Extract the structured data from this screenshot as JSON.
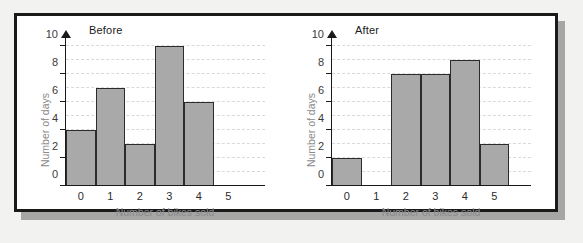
{
  "figure": {
    "background_color": "#f2f2f0",
    "panel_background": "#ffffff",
    "frame_color": "#1a1a1a",
    "bar_fill_color": "#a9a9a9",
    "bar_edge_color": "#2b2b2b",
    "gridline_color": "#d9d9dd",
    "axis_label_color": "#8a8a8a"
  },
  "chart_data": [
    {
      "type": "bar",
      "title": "Before",
      "xlabel": "Number of bikes sold",
      "ylabel": "Number of days",
      "categories": [
        "0",
        "1",
        "2",
        "3",
        "4",
        "5"
      ],
      "values": [
        4,
        7,
        3,
        10,
        6,
        0
      ],
      "xlim": [
        0,
        6
      ],
      "ylim": [
        0,
        10
      ],
      "ytick_labels": [
        "0",
        "2",
        "4",
        "6",
        "8",
        "10"
      ],
      "ytick_values": [
        0,
        2,
        4,
        6,
        8,
        10
      ],
      "gridlines": true,
      "gridline_values": [
        1,
        2,
        3,
        4,
        5,
        6,
        7,
        8,
        9,
        10
      ],
      "legend": "none"
    },
    {
      "type": "bar",
      "title": "After",
      "xlabel": "Number of bikes sold",
      "ylabel": "Number of days",
      "categories": [
        "0",
        "1",
        "2",
        "3",
        "4",
        "5"
      ],
      "values": [
        2,
        0,
        8,
        8,
        9,
        3
      ],
      "xlim": [
        0,
        6
      ],
      "ylim": [
        0,
        10
      ],
      "ytick_labels": [
        "0",
        "2",
        "4",
        "6",
        "8",
        "10"
      ],
      "ytick_values": [
        0,
        2,
        4,
        6,
        8,
        10
      ],
      "gridlines": true,
      "gridline_values": [
        1,
        2,
        3,
        4,
        5,
        6,
        7,
        8,
        9,
        10
      ],
      "legend": "none"
    }
  ]
}
